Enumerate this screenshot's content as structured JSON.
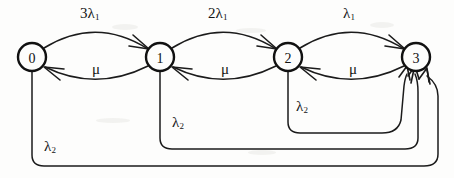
{
  "diagram": {
    "type": "state-transition-diagram",
    "width": 454,
    "height": 178,
    "background_color": "#fdfdfc",
    "ink_color": "#141414",
    "nodes": [
      {
        "id": "0",
        "label": "0",
        "cx": 32,
        "cy": 57,
        "r": 14
      },
      {
        "id": "1",
        "label": "1",
        "cx": 160,
        "cy": 57,
        "r": 14
      },
      {
        "id": "2",
        "label": "2",
        "cx": 288,
        "cy": 57,
        "r": 14
      },
      {
        "id": "3",
        "label": "3",
        "cx": 416,
        "cy": 57,
        "r": 14
      }
    ],
    "forward_edges": [
      {
        "from": "0",
        "to": "1",
        "label": "3λ",
        "sub": "1",
        "label_x": 80,
        "label_y": 6
      },
      {
        "from": "1",
        "to": "2",
        "label": "2λ",
        "sub": "1",
        "label_x": 208,
        "label_y": 6
      },
      {
        "from": "2",
        "to": "3",
        "label": "λ",
        "sub": "1",
        "label_x": 343,
        "label_y": 6
      }
    ],
    "backward_edges": [
      {
        "from": "1",
        "to": "0",
        "label": "μ",
        "label_x": 92,
        "label_y": 62
      },
      {
        "from": "2",
        "to": "1",
        "label": "μ",
        "label_x": 221,
        "label_y": 62
      },
      {
        "from": "3",
        "to": "2",
        "label": "μ",
        "label_x": 349,
        "label_y": 62
      }
    ],
    "failure_edges": [
      {
        "from": "0",
        "to": "3",
        "label": "λ",
        "sub": "2",
        "label_x": 44,
        "label_y": 140,
        "depth": 165
      },
      {
        "from": "1",
        "to": "3",
        "label": "λ",
        "sub": "2",
        "label_x": 172,
        "label_y": 116,
        "depth": 148
      },
      {
        "from": "2",
        "to": "3",
        "label": "λ",
        "sub": "2",
        "label_x": 296,
        "label_y": 100,
        "depth": 132
      }
    ]
  }
}
